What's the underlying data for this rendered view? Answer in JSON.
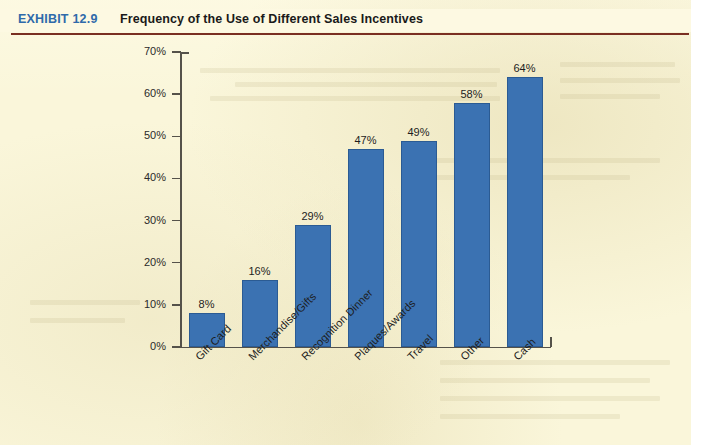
{
  "exhibit": {
    "tag": "EXHIBIT",
    "number": "12.9",
    "title": "Frequency of the Use of Different Sales Incentives",
    "tag_color": "#2f6aaa",
    "rule_color": "#7a2f22"
  },
  "colors": {
    "page_background": "#faf6da",
    "header_background": "#fdf9e2",
    "bar_fill": "#3b72b2",
    "bar_edge": "#2b5b93",
    "axis": "#55524a",
    "text": "#1d1d1d"
  },
  "chart_data": {
    "type": "bar",
    "title": "Frequency of the Use of Different Sales Incentives",
    "xlabel": "",
    "ylabel": "",
    "categories": [
      "Gift Card",
      "Merchandise/Gifts",
      "Recognition Dinner",
      "Plaques/Awards",
      "Travel",
      "Other",
      "Cash"
    ],
    "values": [
      8,
      16,
      29,
      47,
      49,
      58,
      64
    ],
    "value_labels": [
      "8%",
      "16%",
      "29%",
      "47%",
      "49%",
      "58%",
      "64%"
    ],
    "ylim": [
      0,
      70
    ],
    "ytick_values": [
      0,
      10,
      20,
      30,
      40,
      50,
      60,
      70
    ],
    "ytick_labels": [
      "0%",
      "10%",
      "20%",
      "30%",
      "40%",
      "50%",
      "60%",
      "70%"
    ],
    "grid": false,
    "legend": false,
    "legend_position": "none",
    "xtick_rotation": -45
  }
}
